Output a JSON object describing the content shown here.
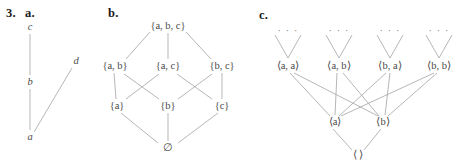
{
  "problem": {
    "number": "3.",
    "parts": [
      {
        "key": "a",
        "label": "a."
      },
      {
        "key": "b",
        "label": "b."
      },
      {
        "key": "c",
        "label": "c."
      }
    ]
  },
  "diagram_a": {
    "caption": "a.",
    "nodes": [
      {
        "id": "c",
        "label": "c",
        "x": 30,
        "y": 27
      },
      {
        "id": "b",
        "label": "b",
        "x": 30,
        "y": 82
      },
      {
        "id": "a",
        "label": "a",
        "x": 30,
        "y": 137
      },
      {
        "id": "d",
        "label": "d",
        "x": 76,
        "y": 61
      }
    ],
    "edges": [
      {
        "from": "c",
        "to": "b"
      },
      {
        "from": "b",
        "to": "a"
      },
      {
        "from": "a",
        "to": "d"
      }
    ]
  },
  "diagram_b": {
    "caption": "b.",
    "nodes": [
      {
        "id": "abc",
        "label": "{a, b, c}",
        "x": 168,
        "y": 26
      },
      {
        "id": "ab",
        "label": "{a, b}",
        "x": 115,
        "y": 66
      },
      {
        "id": "ac",
        "label": "{a, c}",
        "x": 168,
        "y": 66
      },
      {
        "id": "bc",
        "label": "{b, c}",
        "x": 222,
        "y": 66
      },
      {
        "id": "a",
        "label": "{a}",
        "x": 117,
        "y": 106
      },
      {
        "id": "b",
        "label": "{b}",
        "x": 168,
        "y": 106
      },
      {
        "id": "c",
        "label": "{c}",
        "x": 222,
        "y": 106
      },
      {
        "id": "empty",
        "label": "∅",
        "x": 168,
        "y": 147
      }
    ],
    "edges": [
      {
        "from": "abc",
        "to": "ab"
      },
      {
        "from": "abc",
        "to": "ac"
      },
      {
        "from": "abc",
        "to": "bc"
      },
      {
        "from": "ab",
        "to": "a"
      },
      {
        "from": "ab",
        "to": "b"
      },
      {
        "from": "ac",
        "to": "a"
      },
      {
        "from": "ac",
        "to": "c"
      },
      {
        "from": "bc",
        "to": "b"
      },
      {
        "from": "bc",
        "to": "c"
      },
      {
        "from": "a",
        "to": "empty"
      },
      {
        "from": "b",
        "to": "empty"
      },
      {
        "from": "c",
        "to": "empty"
      }
    ]
  },
  "diagram_c": {
    "caption": "c.",
    "ellipsis": "· · ·",
    "nodes": [
      {
        "id": "aa",
        "label": "⟨a, a⟩",
        "x": 288,
        "y": 66
      },
      {
        "id": "ab",
        "label": "⟨a, b⟩",
        "x": 339,
        "y": 66
      },
      {
        "id": "ba",
        "label": "⟨b, a⟩",
        "x": 390,
        "y": 66
      },
      {
        "id": "bb",
        "label": "⟨b, b⟩",
        "x": 439,
        "y": 66
      },
      {
        "id": "a",
        "label": "⟨a⟩",
        "x": 335,
        "y": 122
      },
      {
        "id": "b",
        "label": "⟨b⟩",
        "x": 383,
        "y": 122
      },
      {
        "id": "empty",
        "label": "⟨ ⟩",
        "x": 358,
        "y": 155
      }
    ],
    "edges": [
      {
        "from": "aa",
        "to": "a"
      },
      {
        "from": "aa",
        "to": "b"
      },
      {
        "from": "ab",
        "to": "a"
      },
      {
        "from": "ab",
        "to": "b"
      },
      {
        "from": "ba",
        "to": "a"
      },
      {
        "from": "ba",
        "to": "b"
      },
      {
        "from": "bb",
        "to": "a"
      },
      {
        "from": "bb",
        "to": "b"
      },
      {
        "from": "a",
        "to": "empty"
      },
      {
        "from": "b",
        "to": "empty"
      }
    ]
  },
  "colors": {
    "line": "#a9a9a9",
    "node_text": "#4a4a4a",
    "label_text": "#1a1a1a",
    "background": "#ffffff"
  }
}
